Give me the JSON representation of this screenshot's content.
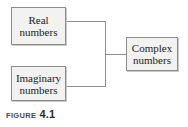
{
  "figure": {
    "caption_word": "FIGURE",
    "caption_number": "4.1"
  },
  "diagram": {
    "type": "relationship-tree",
    "background_color": "#ffffff",
    "box_fill_color": "#f2f2f0",
    "box_border_color": "#8d8d8d",
    "connector_color": "#8d8d8d",
    "nodes": [
      {
        "id": "real",
        "line1": "Real",
        "line2": "numbers",
        "position": "top-left"
      },
      {
        "id": "imaginary",
        "line1": "Imaginary",
        "line2": "numbers",
        "position": "bottom-left"
      },
      {
        "id": "complex",
        "line1": "Complex",
        "line2": "numbers",
        "position": "right-center"
      }
    ],
    "connections": [
      {
        "from": "real",
        "to": "complex"
      },
      {
        "from": "imaginary",
        "to": "complex"
      }
    ]
  }
}
